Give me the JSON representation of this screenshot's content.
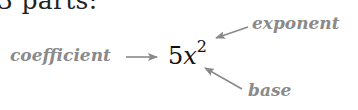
{
  "heading": {
    "text": "3 parts:"
  },
  "expression": {
    "coefficient": "5",
    "base": "x",
    "exponent": "2"
  },
  "labels": {
    "coefficient": "coefficient",
    "exponent": "exponent",
    "base": "base"
  },
  "colors": {
    "label_gray": "#8a8a8a",
    "expression_text": "#111111",
    "heading_text": "#222222",
    "background": "#ffffff"
  }
}
